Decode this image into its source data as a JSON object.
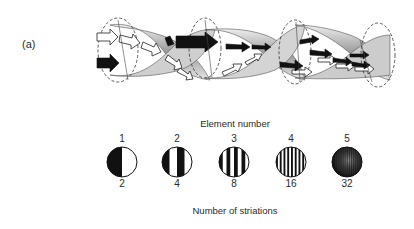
{
  "panel": {
    "label": "(a)"
  },
  "helix": {
    "description": "Twisted helical strip with cone cross-sections; arrows show polarization direction rotating along the strip",
    "arrow_fill_light": "#ffffff",
    "arrow_fill_dark": "#111111",
    "surface_color": "#bdbdbd"
  },
  "elements": {
    "title": "Element number",
    "footer": "Number of striations",
    "items": [
      {
        "element_number": "1",
        "striations": "2",
        "stripes": 2
      },
      {
        "element_number": "2",
        "striations": "4",
        "stripes": 4
      },
      {
        "element_number": "3",
        "striations": "8",
        "stripes": 8
      },
      {
        "element_number": "4",
        "striations": "16",
        "stripes": 16
      },
      {
        "element_number": "5",
        "striations": "32",
        "stripes": 32
      }
    ]
  }
}
